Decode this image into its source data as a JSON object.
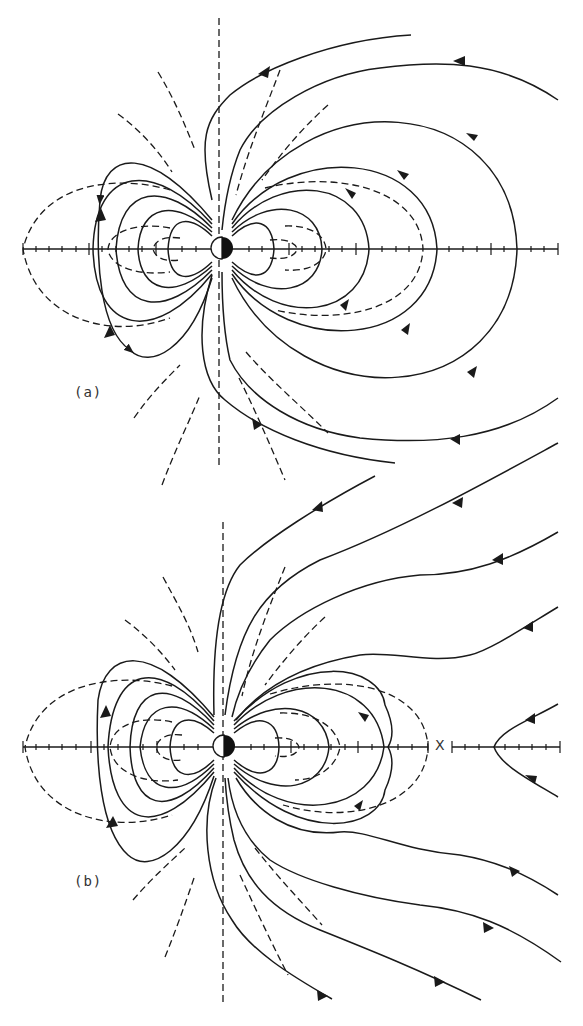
{
  "figure": {
    "panels": [
      {
        "id": "a",
        "label": "(a)",
        "center": [
          222,
          248
        ],
        "axis_y": 249,
        "axis_x_range": [
          23,
          558
        ],
        "tick_spacing_px": 13.5
      },
      {
        "id": "b",
        "label": "(b)",
        "center": [
          224,
          746
        ],
        "axis_y": 747,
        "axis_x_range": [
          23,
          560
        ],
        "neutral_point_label": "X",
        "neutral_point_x": 440,
        "tick_spacing_px": 13.5
      }
    ],
    "legend": {
      "solid": "magnetic field lines",
      "dashed": "reference/contour lines"
    },
    "colors": {
      "ink": "#1a1a1a",
      "background": "#ffffff"
    }
  }
}
